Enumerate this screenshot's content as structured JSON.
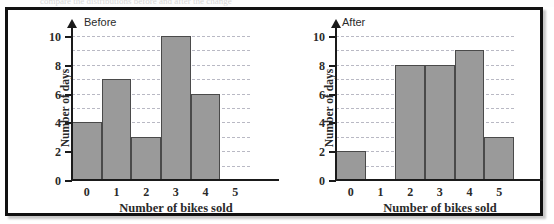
{
  "figure": {
    "top_sliver_ghost_text": "compare the distributions before and after the change"
  },
  "colors": {
    "bar_fill": "#9a9a9a",
    "bar_stroke": "#4a4a4a",
    "gridline": "#b9b9c4",
    "axis": "#1a1a1a",
    "frame": "#111111",
    "background": "#ffffff"
  },
  "charts": [
    {
      "id": "before",
      "title": "Before",
      "chart_data": {
        "type": "bar",
        "title": "Before",
        "xlabel": "Number of bikes sold",
        "ylabel": "Number of days",
        "categories": [
          "0",
          "1",
          "2",
          "3",
          "4",
          "5"
        ],
        "values": [
          4,
          7,
          3,
          10,
          6,
          0
        ],
        "ylim": [
          0,
          10
        ],
        "ytick_labels": [
          "0",
          "2",
          "4",
          "6",
          "8",
          "10"
        ],
        "ytick_values": [
          0,
          2,
          4,
          6,
          8,
          10
        ],
        "gridline_values": [
          1,
          2,
          3,
          4,
          5,
          6,
          7,
          8,
          9,
          10
        ],
        "grid": true,
        "legend": "none"
      }
    },
    {
      "id": "after",
      "title": "After",
      "chart_data": {
        "type": "bar",
        "title": "After",
        "xlabel": "Number of bikes sold",
        "ylabel": "Number of days",
        "categories": [
          "0",
          "1",
          "2",
          "3",
          "4",
          "5"
        ],
        "values": [
          2,
          0,
          8,
          8,
          9,
          3
        ],
        "ylim": [
          0,
          10
        ],
        "ytick_labels": [
          "0",
          "2",
          "4",
          "6",
          "8",
          "10"
        ],
        "ytick_values": [
          0,
          2,
          4,
          6,
          8,
          10
        ],
        "gridline_values": [
          1,
          2,
          3,
          4,
          5,
          6,
          7,
          8,
          9,
          10
        ],
        "grid": true,
        "legend": "none"
      }
    }
  ]
}
